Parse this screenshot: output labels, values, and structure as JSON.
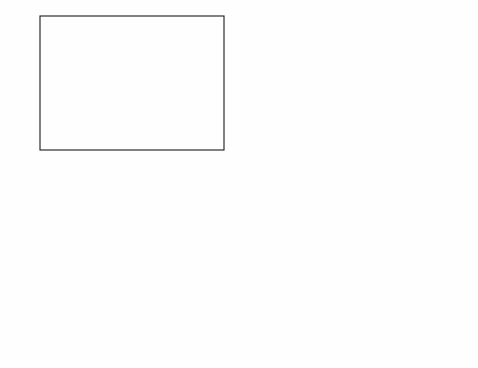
{
  "figure": {
    "background": "#ffffff",
    "panel_count": 4
  },
  "series_colors": [
    "#1a1a1a",
    "#9a9a9a",
    "#3c3c3c",
    "#c0c0c0",
    "#2a2a2a",
    "#b5b5b5",
    "#151515",
    "#555555",
    "#8f8f8f",
    "#303030",
    "#cfcfcf"
  ],
  "legend_labels": [
    "0mM",
    "3mM",
    "6mM",
    "9mM",
    "12mM",
    "15mM",
    "18mM",
    "21mM",
    "24mM",
    "27mM",
    "30mM"
  ],
  "chart_data": [
    {
      "id": "panel-top-left",
      "type": "line",
      "title": "",
      "xlabel": "Time (sec)",
      "ylabel": "Oxygen Concentration ( μM)",
      "xlim": [
        0,
        2
      ],
      "ylim": [
        0,
        300
      ],
      "xticks": [
        0,
        0.5,
        1,
        1.5,
        2
      ],
      "xticklabels": [
        "0",
        "0.5",
        "1",
        "1.5",
        "2"
      ],
      "yticks": [
        0,
        50,
        100,
        150,
        200,
        250,
        300
      ],
      "yticklabels": [
        "0",
        "50",
        "100",
        "150",
        "200",
        "250",
        "300"
      ],
      "grid": false,
      "legend_position": "top-right",
      "legend": [
        "0mM",
        "3mM",
        "6mM",
        "9mM",
        "12mM",
        "15mM",
        "18mM",
        "21mM",
        "24mM",
        "27mM",
        "30mM"
      ],
      "series": [
        {
          "name": "0mM",
          "plateau": 250,
          "onset": 0.0,
          "rise": 0.02,
          "start": 250
        },
        {
          "name": "3mM",
          "plateau": 232,
          "onset": 0.16,
          "rise": 0.06,
          "start": 2
        },
        {
          "name": "6mM",
          "plateau": 213,
          "onset": 0.25,
          "rise": 0.06,
          "start": 2
        },
        {
          "name": "9mM",
          "plateau": 192,
          "onset": 0.34,
          "rise": 0.06,
          "start": 2
        },
        {
          "name": "12mM",
          "plateau": 171,
          "onset": 0.43,
          "rise": 0.06,
          "start": 2
        },
        {
          "name": "15mM",
          "plateau": 148,
          "onset": 0.52,
          "rise": 0.07,
          "start": 2
        },
        {
          "name": "18mM",
          "plateau": 125,
          "onset": 0.62,
          "rise": 0.07,
          "start": 2
        },
        {
          "name": "21mM",
          "plateau": 102,
          "onset": 0.73,
          "rise": 0.07,
          "start": 2
        },
        {
          "name": "24mM",
          "plateau": 79,
          "onset": 0.85,
          "rise": 0.08,
          "start": 2
        },
        {
          "name": "27mM",
          "plateau": 55,
          "onset": 1.02,
          "rise": 0.09,
          "start": 2
        },
        {
          "name": "30mM",
          "plateau": 30,
          "onset": 1.28,
          "rise": 0.12,
          "start": 2
        }
      ]
    },
    {
      "id": "panel-top-right",
      "type": "line",
      "title": "",
      "xlabel": "Time (sec)",
      "ylabel": "Glucose Concentration (mM)",
      "xlim": [
        0,
        2
      ],
      "ylim": [
        0,
        30
      ],
      "xticks": [
        0,
        0.5,
        1,
        1.5,
        2
      ],
      "xticklabels": [
        "0",
        "0.5",
        "1",
        "1.5",
        "2"
      ],
      "yticks": [
        0,
        5,
        10,
        15,
        20,
        25,
        30
      ],
      "yticklabels": [
        "0",
        "5",
        "10",
        "15",
        "20",
        "25",
        "30"
      ],
      "grid": false,
      "legend_position": "inset-top-right",
      "series": [
        {
          "name": "0mM",
          "start": 0,
          "zero_time": 0.02
        },
        {
          "name": "3mM",
          "start": 3,
          "zero_time": 0.3
        },
        {
          "name": "6mM",
          "start": 6,
          "zero_time": 0.4
        },
        {
          "name": "9mM",
          "start": 9,
          "zero_time": 0.5
        },
        {
          "name": "12mM",
          "start": 12,
          "zero_time": 0.58
        },
        {
          "name": "15mM",
          "start": 15,
          "zero_time": 0.66
        },
        {
          "name": "18mM",
          "start": 18,
          "zero_time": 0.74
        },
        {
          "name": "21mM",
          "start": 21,
          "zero_time": 0.83
        },
        {
          "name": "24mM",
          "start": 24,
          "zero_time": 0.93
        },
        {
          "name": "27mM",
          "start": 27,
          "zero_time": 1.05
        },
        {
          "name": "30mM",
          "start": 30,
          "zero_time": 1.2
        }
      ],
      "inset": {
        "xlabel": "Time (sec)",
        "ylabel": "Glucose Concentration (mM)",
        "xlim": [
          1.5,
          2
        ],
        "ylim": [
          0,
          0.05
        ],
        "xticklabels": [
          "1.5",
          "1.6",
          "1.7",
          "1.8",
          "1.9",
          "2"
        ],
        "yticklabels": [
          "0.05",
          "0.045",
          "0.04",
          "0.035",
          "0.03",
          "0.025",
          "0.02",
          "0.015",
          "0.01",
          "0.005",
          "0"
        ],
        "legend": [
          "0mM",
          "3mM",
          "6mM",
          "9mM",
          "12mM",
          "15mM",
          "18mM",
          "21mM",
          "24mM",
          "27mM",
          "30mM"
        ],
        "levels": [
          0.0005,
          0.0035,
          0.0065,
          0.0095,
          0.0125,
          0.0155,
          0.018,
          0.021,
          0.0245,
          0.028,
          0.0295
        ]
      }
    },
    {
      "id": "panel-bottom-left",
      "type": "line",
      "title": "",
      "xlabel": "Time (sec)",
      "ylabel": "Oxygen Concentration ( μM)",
      "xlim": [
        0,
        2
      ],
      "ylim": [
        160,
        260
      ],
      "xticks": [
        0,
        0.5,
        1,
        1.5,
        2
      ],
      "xticklabels": [
        "0",
        "0.5",
        "1",
        "1.5",
        "2"
      ],
      "yticks": [
        160,
        170,
        180,
        190,
        200,
        210,
        220,
        230,
        240,
        250,
        260
      ],
      "yticklabels": [
        "160",
        "170",
        "180",
        "190",
        "200",
        "210",
        "220",
        "230",
        "240",
        "250",
        "260"
      ],
      "grid": false,
      "legend_position": "bottom-right",
      "legend": [
        "0mM",
        "3mM",
        "6mM",
        "9mM",
        "12mM",
        "15mM",
        "18mM",
        "21mM",
        "24mM",
        "27mM",
        "30mM"
      ],
      "baseline": 175,
      "series": [
        {
          "name": "0mM",
          "plateau": 250,
          "onset": 0.0,
          "rise": 0.02
        },
        {
          "name": "3mM",
          "plateau": 246,
          "onset": 0.1,
          "rise": 0.09
        },
        {
          "name": "6mM",
          "plateau": 242,
          "onset": 0.17,
          "rise": 0.1
        },
        {
          "name": "9mM",
          "plateau": 238,
          "onset": 0.24,
          "rise": 0.11
        },
        {
          "name": "12mM",
          "plateau": 234,
          "onset": 0.3,
          "rise": 0.12
        },
        {
          "name": "15mM",
          "plateau": 230,
          "onset": 0.37,
          "rise": 0.13
        },
        {
          "name": "18mM",
          "plateau": 226,
          "onset": 0.44,
          "rise": 0.14
        },
        {
          "name": "21mM",
          "plateau": 222,
          "onset": 0.52,
          "rise": 0.15
        },
        {
          "name": "24mM",
          "plateau": 218,
          "onset": 0.61,
          "rise": 0.16
        },
        {
          "name": "27mM",
          "plateau": 215,
          "onset": 0.72,
          "rise": 0.18
        },
        {
          "name": "30mM",
          "plateau": 211,
          "onset": 0.86,
          "rise": 0.21
        }
      ]
    },
    {
      "id": "panel-bottom-right",
      "type": "line",
      "title": "",
      "xlabel": "Time (sec)",
      "ylabel": "Glucose Concentration (mM)",
      "xlim": [
        0,
        2
      ],
      "ylim": [
        0,
        30
      ],
      "xticks": [
        0,
        0.5,
        1,
        1.5,
        2
      ],
      "xticklabels": [
        "0",
        "0.5",
        "1",
        "1.5",
        "2"
      ],
      "yticks": [
        0,
        5,
        10,
        15,
        20,
        25,
        30
      ],
      "yticklabels": [
        "0",
        "5",
        "10",
        "15",
        "20",
        "25",
        "30"
      ],
      "grid": false,
      "legend_position": "inset-top-right",
      "series": [
        {
          "name": "0mM",
          "start": 0,
          "tau": 0.05
        },
        {
          "name": "3mM",
          "start": 3,
          "tau": 0.1
        },
        {
          "name": "6mM",
          "start": 6,
          "tau": 0.12
        },
        {
          "name": "9mM",
          "start": 9,
          "tau": 0.14
        },
        {
          "name": "12mM",
          "start": 12,
          "tau": 0.16
        },
        {
          "name": "15mM",
          "start": 15,
          "tau": 0.18
        },
        {
          "name": "18mM",
          "start": 18,
          "tau": 0.2
        },
        {
          "name": "21mM",
          "start": 21,
          "tau": 0.22
        },
        {
          "name": "24mM",
          "start": 24,
          "tau": 0.24
        },
        {
          "name": "27mM",
          "start": 27,
          "tau": 0.27
        },
        {
          "name": "30mM",
          "start": 30,
          "tau": 0.31
        }
      ],
      "inset": {
        "xlabel": "Time (sec)",
        "ylabel": "Glucose Concentration (mM)",
        "xlim": [
          1.5,
          2
        ],
        "ylim": [
          0,
          1.0
        ],
        "xticklabels": [
          "1.5",
          "1.6",
          "1.7",
          "1.8",
          "1.9",
          "2"
        ],
        "yticklabels": [
          "1.0",
          "0.4"
        ],
        "legend": [
          "0mM",
          "3mM",
          "6mM",
          "9mM",
          "12mM",
          "15mM",
          "18mM",
          "21mM",
          "24mM",
          "27mM",
          "30mM"
        ],
        "levels": [
          0.1,
          0.18,
          0.26,
          0.33,
          0.4,
          0.47,
          0.55,
          0.62,
          0.7,
          0.78,
          0.86
        ]
      }
    }
  ]
}
